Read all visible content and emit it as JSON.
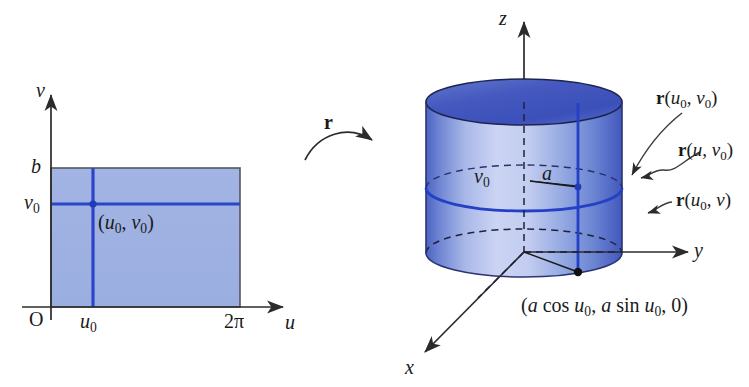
{
  "figure": {
    "colors": {
      "rect_fill": "#9fb2e2",
      "rect_border": "#4a4a52",
      "grid_line": "#2a46c8",
      "cylinder_light": "#c3cdf0",
      "cylinder_mid": "#7f9add",
      "cylinder_dark": "#3b52bb",
      "cylinder_top_fill": "#4157bd",
      "axis": "#2b2b2b",
      "text": "#1a1a1a"
    }
  },
  "uv_plane": {
    "axis_v_label": "v",
    "axis_u_label": "u",
    "origin_label": "O",
    "tick_b": "b",
    "tick_v0_base": "v",
    "tick_v0_sub": "0",
    "tick_u0_base": "u",
    "tick_u0_sub": "0",
    "tick_2pi": "2π",
    "point_label_open": "(",
    "point_label_u": "u",
    "point_label_u_sub": "0",
    "point_label_comma": ", ",
    "point_label_v": "v",
    "point_label_v_sub": "0",
    "point_label_close": ")"
  },
  "mapping": {
    "arrow_label": "r"
  },
  "cylinder": {
    "axis_z_label": "z",
    "axis_y_label": "y",
    "axis_x_label": "x",
    "height_label_base": "v",
    "height_label_sub": "0",
    "radius_label": "a",
    "callouts": [
      {
        "name": "point",
        "bold": "r",
        "open": "(",
        "arg1": "u",
        "arg1_sub": "0",
        "comma": ", ",
        "arg2": "v",
        "arg2_sub": "0",
        "close": ")"
      },
      {
        "name": "u-curve",
        "bold": "r",
        "open": "(",
        "arg1": "u",
        "arg1_sub": "",
        "comma": ", ",
        "arg2": "v",
        "arg2_sub": "0",
        "close": ")"
      },
      {
        "name": "v-curve",
        "bold": "r",
        "open": "(",
        "arg1": "u",
        "arg1_sub": "0",
        "comma": ", ",
        "arg2": "v",
        "arg2_sub": "",
        "close": ")"
      }
    ],
    "base_point_label": {
      "open": "(",
      "a1": "a",
      "cos": " cos ",
      "u1": "u",
      "u1_sub": "0",
      "comma1": ", ",
      "a2": "a",
      "sin": " sin ",
      "u2": "u",
      "u2_sub": "0",
      "comma2": ", ",
      "zero": "0",
      "close": ")"
    }
  }
}
